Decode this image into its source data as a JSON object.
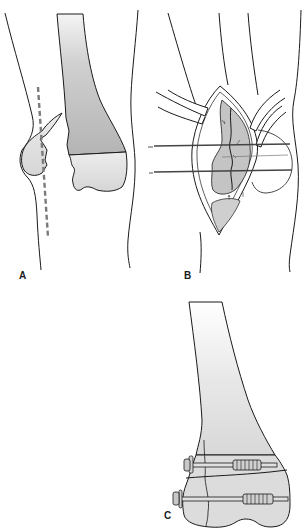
{
  "figure": {
    "colors": {
      "outline": "#1a1a1a",
      "bone_shaft_fill": "#bdbdbd",
      "bone_condyle_fill": "#e2e2e2",
      "incision_dash": "#7a7a7a",
      "background": "#ffffff"
    },
    "panels": [
      {
        "id": "A",
        "label": "A",
        "content": "Anteroposterior view of knee with displaced medial femoral condyle fracture and dashed line marking skin incision"
      },
      {
        "id": "B",
        "label": "B",
        "content": "Surgical exposure through incision with retractors; fracture reduced and held with two transverse Kirschner wires"
      },
      {
        "id": "C",
        "label": "C",
        "content": "Final fixation of distal femur with two transverse cancellous lag screws and washers"
      }
    ]
  }
}
